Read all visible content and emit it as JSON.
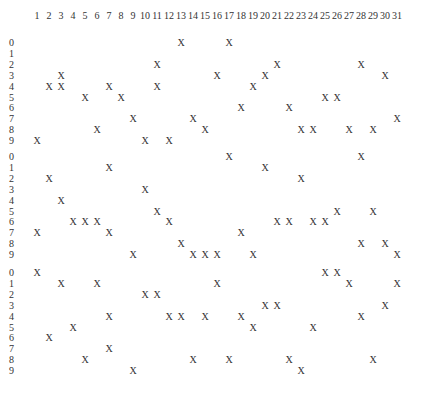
{
  "columns": [
    "1",
    "2",
    "3",
    "4",
    "5",
    "6",
    "7",
    "8",
    "9",
    "10",
    "11",
    "12",
    "13",
    "14",
    "15",
    "16",
    "17",
    "18",
    "19",
    "20",
    "21",
    "22",
    "23",
    "24",
    "25",
    "26",
    "27",
    "28",
    "29",
    "30",
    "31"
  ],
  "mark_symbol": "X",
  "blocks": [
    {
      "top": 37,
      "rows": [
        {
          "label": "0",
          "cols": [
            13,
            17
          ]
        },
        {
          "label": "1",
          "cols": []
        },
        {
          "label": "2",
          "cols": [
            11,
            21,
            28
          ]
        },
        {
          "label": "3",
          "cols": [
            3,
            16,
            20,
            30
          ]
        },
        {
          "label": "4",
          "cols": [
            2,
            3,
            7,
            11,
            19
          ]
        },
        {
          "label": "5",
          "cols": [
            5,
            8,
            25,
            26
          ]
        },
        {
          "label": "6",
          "cols": [
            18,
            22
          ]
        },
        {
          "label": "7",
          "cols": [
            9,
            14,
            31
          ]
        },
        {
          "label": "8",
          "cols": [
            6,
            15,
            23,
            24,
            27,
            29
          ]
        },
        {
          "label": "9",
          "cols": [
            1,
            10,
            12
          ]
        }
      ]
    },
    {
      "top": 151,
      "rows": [
        {
          "label": "0",
          "cols": [
            17,
            28
          ]
        },
        {
          "label": "1",
          "cols": [
            7,
            20
          ]
        },
        {
          "label": "2",
          "cols": [
            2,
            23
          ]
        },
        {
          "label": "3",
          "cols": [
            10
          ]
        },
        {
          "label": "4",
          "cols": [
            3
          ]
        },
        {
          "label": "5",
          "cols": [
            11,
            26,
            29
          ]
        },
        {
          "label": "6",
          "cols": [
            4,
            5,
            6,
            12,
            21,
            22,
            24,
            25
          ]
        },
        {
          "label": "7",
          "cols": [
            1,
            7,
            18
          ]
        },
        {
          "label": "8",
          "cols": [
            13,
            28,
            30
          ]
        },
        {
          "label": "9",
          "cols": [
            9,
            14,
            15,
            16,
            19,
            31
          ]
        }
      ]
    },
    {
      "top": 267,
      "rows": [
        {
          "label": "0",
          "cols": [
            1,
            25,
            26
          ]
        },
        {
          "label": "1",
          "cols": [
            3,
            6,
            16,
            27,
            31
          ]
        },
        {
          "label": "2",
          "cols": [
            10,
            11
          ]
        },
        {
          "label": "3",
          "cols": [
            20,
            21,
            30
          ]
        },
        {
          "label": "4",
          "cols": [
            7,
            12,
            13,
            15,
            18,
            28
          ]
        },
        {
          "label": "5",
          "cols": [
            4,
            19,
            24
          ]
        },
        {
          "label": "6",
          "cols": [
            2
          ]
        },
        {
          "label": "7",
          "cols": [
            7
          ]
        },
        {
          "label": "8",
          "cols": [
            5,
            14,
            17,
            22,
            29
          ]
        },
        {
          "label": "9",
          "cols": [
            9,
            23
          ]
        }
      ]
    }
  ]
}
